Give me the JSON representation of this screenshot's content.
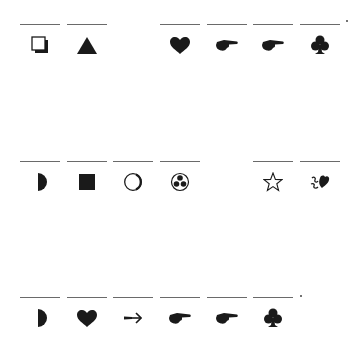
{
  "worksheet": {
    "rows": [
      {
        "slots": [
          {
            "symbol": "shadowed-square-icon",
            "answer": ""
          },
          {
            "symbol": "triangle-icon",
            "answer": ""
          },
          {
            "symbol": "none",
            "answer": null
          },
          {
            "symbol": "heart-icon",
            "answer": ""
          },
          {
            "symbol": "pointing-hand-icon",
            "answer": ""
          },
          {
            "symbol": "pointing-hand-icon",
            "answer": ""
          },
          {
            "symbol": "club-icon",
            "answer": ""
          }
        ]
      },
      {
        "slots": [
          {
            "symbol": "half-circle-icon",
            "answer": ""
          },
          {
            "symbol": "square-icon",
            "answer": ""
          },
          {
            "symbol": "circle-icon",
            "answer": ""
          },
          {
            "symbol": "trefoil-circle-icon",
            "answer": ""
          },
          {
            "symbol": "none",
            "answer": null
          },
          {
            "symbol": "star-outline-icon",
            "answer": ""
          },
          {
            "symbol": "floral-heart-icon",
            "answer": ""
          }
        ]
      },
      {
        "slots": [
          {
            "symbol": "half-circle-icon",
            "answer": ""
          },
          {
            "symbol": "heart-icon",
            "answer": ""
          },
          {
            "symbol": "arrow-icon",
            "answer": ""
          },
          {
            "symbol": "pointing-hand-icon",
            "answer": ""
          },
          {
            "symbol": "pointing-hand-icon",
            "answer": ""
          },
          {
            "symbol": "club-icon",
            "answer": ""
          }
        ]
      }
    ],
    "ink_color": "#1a1a1a",
    "line_color": "#6a6a6a"
  }
}
